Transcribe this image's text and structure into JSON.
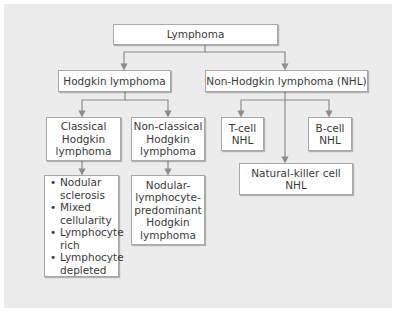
{
  "diagram": {
    "root": "Lymphoma",
    "level1": {
      "hodgkin": "Hodgkin lymphoma",
      "nhl": "Non-Hodgkin lymphoma (NHL)"
    },
    "hodgkin_children": {
      "classical": [
        "Classical",
        "Hodgkin",
        "lymphoma"
      ],
      "nonclassical": [
        "Non-classical",
        "Hodgkin",
        "lymphoma"
      ]
    },
    "classical_subtypes": [
      [
        "Nodular",
        "sclerosis"
      ],
      [
        "Mixed",
        "cellularity"
      ],
      [
        "Lymphocyte",
        "rich"
      ],
      [
        "Lymphocyte",
        "depleted"
      ]
    ],
    "nonclassical_subtype": [
      "Nodular-",
      "lymphocyte-",
      "predominant",
      "Hodgkin",
      "lymphoma"
    ],
    "nhl_children": {
      "tcell": [
        "T-cell",
        "NHL"
      ],
      "bcell": [
        "B-cell",
        "NHL"
      ],
      "nk": [
        "Natural-killer cell",
        "NHL"
      ]
    },
    "colors": {
      "background": "#ececec",
      "box_fill": "#ffffff",
      "box_border": "#a8a8a8",
      "connector": "#8c8c8c",
      "text": "#3a3a3a"
    }
  }
}
